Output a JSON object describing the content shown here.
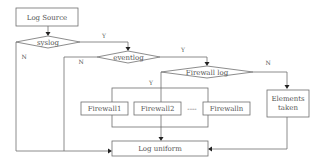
{
  "diagram": {
    "type": "flowchart",
    "nodes": {
      "log_source": "Log Source",
      "syslog": "syslog",
      "eventlog": "eventlog",
      "firewall_log": "Firewall log",
      "firewall1": "Firewall1",
      "firewall2": "Firewall2",
      "ellipsis": "----",
      "firewalln": "Firewalln",
      "elements_taken_line1": "Elements",
      "elements_taken_line2": "taken",
      "log_uniform": "Log uniform"
    },
    "edge_labels": {
      "syslog_yes": "Y",
      "syslog_no": "N",
      "eventlog_yes": "Y",
      "eventlog_no": "N",
      "firewall_yes": "Y",
      "firewall_no": "N"
    },
    "colors": {
      "stroke": "#6e6e6e",
      "text": "#555555",
      "arrow": "#222222",
      "background": "#ffffff"
    }
  }
}
